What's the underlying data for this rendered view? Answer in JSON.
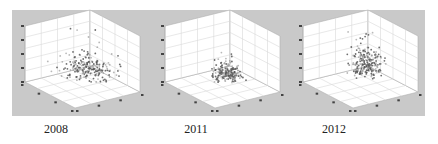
{
  "chart_data": [
    {
      "type": "scatter",
      "subtype": "3d-scatter",
      "title": "2008",
      "zlabel": "",
      "xlabel": "",
      "ylabel": "",
      "zticks": [
        "20",
        "40",
        "60",
        "80",
        "100"
      ],
      "xticks": [
        "0",
        "20",
        "40",
        "60"
      ],
      "yticks": [
        "0",
        "20",
        "40",
        "60"
      ],
      "zlim": [
        20,
        100
      ],
      "xlim": [
        0,
        60
      ],
      "ylim": [
        0,
        60
      ],
      "grid": true,
      "cluster": {
        "x_center": 0.62,
        "y_center": 0.55,
        "z_center": 0.25,
        "spread": 0.18,
        "count": 220
      },
      "description": "dense cluster near floor right-center, sparse points rising to ~z=90"
    },
    {
      "type": "scatter",
      "subtype": "3d-scatter",
      "title": "2011",
      "zticks": [
        "20",
        "40",
        "60",
        "80",
        "100"
      ],
      "xticks": [
        "0",
        "20",
        "40",
        "60"
      ],
      "yticks": [
        "0",
        "20",
        "40",
        "60"
      ],
      "zlim": [
        20,
        100
      ],
      "xlim": [
        0,
        60
      ],
      "ylim": [
        0,
        60
      ],
      "grid": true,
      "cluster": {
        "x_center": 0.55,
        "y_center": 0.5,
        "z_center": 0.22,
        "spread": 0.1,
        "count": 200
      },
      "description": "tight compact cluster near floor center"
    },
    {
      "type": "scatter",
      "subtype": "3d-scatter",
      "title": "2012",
      "zticks": [
        "20",
        "40",
        "60",
        "80",
        "100"
      ],
      "xticks": [
        "0",
        "20",
        "40",
        "60"
      ],
      "yticks": [
        "0",
        "20",
        "40",
        "60"
      ],
      "zlim": [
        20,
        100
      ],
      "xlim": [
        0,
        60
      ],
      "ylim": [
        0,
        60
      ],
      "grid": true,
      "cluster": {
        "x_center": 0.55,
        "y_center": 0.5,
        "z_center": 0.35,
        "spread": 0.14,
        "count": 220
      },
      "description": "vertically elongated cluster from floor up to ~z=80"
    }
  ],
  "panels": [
    {
      "caption": "2008",
      "offset_x": 0,
      "seed": 11,
      "cx": 0.62,
      "cy": 0.55,
      "cz": 0.22,
      "sxy": 0.16,
      "sz": 0.14,
      "n": 220
    },
    {
      "caption": "2011",
      "offset_x": 140,
      "seed": 23,
      "cx": 0.55,
      "cy": 0.48,
      "cz": 0.2,
      "sxy": 0.09,
      "sz": 0.1,
      "n": 200
    },
    {
      "caption": "2012",
      "offset_x": 278,
      "seed": 37,
      "cx": 0.55,
      "cy": 0.48,
      "cz": 0.32,
      "sxy": 0.1,
      "sz": 0.22,
      "n": 220
    }
  ],
  "colors": {
    "background": "#c9c9c9",
    "pane": "#ffffff",
    "grid": "#d8d8d8",
    "edge": "#b0b0b0",
    "point": "#555555",
    "tick": "#444444"
  }
}
